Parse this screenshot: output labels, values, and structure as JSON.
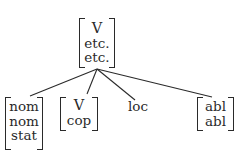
{
  "diagram": {
    "type": "tree",
    "root": {
      "features": [
        "V",
        "etc.",
        "etc."
      ]
    },
    "children": [
      {
        "features": [
          "nom",
          "nom",
          "stat"
        ],
        "bracketed": true
      },
      {
        "features": [
          "V",
          "cop"
        ],
        "bracketed": true
      },
      {
        "features": [
          "loc"
        ],
        "bracketed": false
      },
      {
        "features": [
          "abl",
          "abl"
        ],
        "bracketed": true
      }
    ],
    "edges": [
      {
        "from": "root",
        "to": "child-0"
      },
      {
        "from": "root",
        "to": "child-1"
      },
      {
        "from": "root",
        "to": "child-2"
      },
      {
        "from": "root",
        "to": "child-3"
      }
    ],
    "colors": {
      "ink": "#2a2a2a",
      "background": "#ffffff"
    }
  }
}
